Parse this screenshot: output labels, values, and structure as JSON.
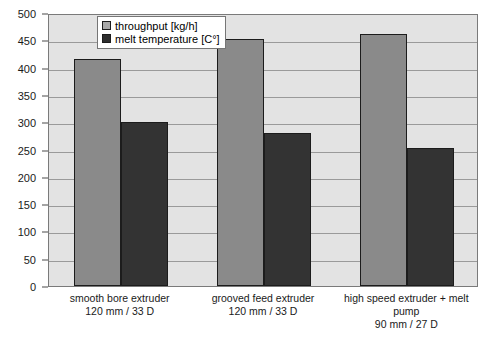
{
  "chart_data": {
    "type": "bar",
    "title": "",
    "subtitle": "",
    "xlabel": "",
    "ylabel": "",
    "ylim": [
      0,
      500
    ],
    "yticks": [
      0,
      50,
      100,
      150,
      200,
      250,
      300,
      350,
      400,
      450,
      500
    ],
    "ytick_labels": [
      "0",
      "50",
      "100",
      "150",
      "200",
      "250",
      "300",
      "350",
      "400",
      "450",
      "500"
    ],
    "grid": true,
    "legend_position": "top-center",
    "categories": [
      "smooth bore extruder 120 mm / 33 D",
      "grooved feed extruder 120 mm / 33 D",
      "high speed extruder + melt pump 90 mm / 27 D"
    ],
    "category_lines": [
      [
        "smooth bore extruder",
        "120 mm / 33 D"
      ],
      [
        "grooved feed extruder",
        "120 mm / 33 D"
      ],
      [
        "high speed extruder + melt",
        "pump",
        "90 mm / 27 D"
      ]
    ],
    "series": [
      {
        "name": "throughput [kg/h]",
        "color": "#8a8a8a",
        "values": [
          415,
          452,
          462
        ]
      },
      {
        "name": "melt temperature [C°]",
        "color": "#333333",
        "values": [
          300,
          281,
          253
        ]
      }
    ]
  },
  "legend": {
    "items": [
      {
        "label": "throughput [kg/h]"
      },
      {
        "label": "melt temperature [C°]"
      }
    ]
  }
}
